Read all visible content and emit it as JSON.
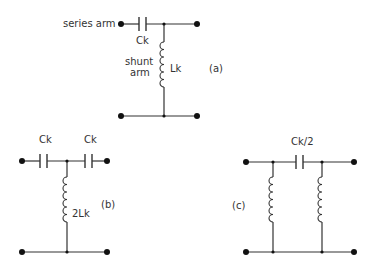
{
  "diagram": {
    "type": "circuit-schematic",
    "colors": {
      "line": "#333333",
      "terminal": "#111111",
      "background": "#ffffff"
    },
    "circuit_a": {
      "label": "(a)",
      "series_label": "series arm",
      "shunt_label_line1": "shunt",
      "shunt_label_line2": "arm",
      "capacitor_label": "Ck",
      "inductor_label": "Lk"
    },
    "circuit_b": {
      "label": "(b)",
      "capacitor1_label": "Ck",
      "capacitor2_label": "Ck",
      "inductor_label": "2Lk"
    },
    "circuit_c": {
      "label": "(c)",
      "capacitor_label": "Ck/2"
    }
  }
}
